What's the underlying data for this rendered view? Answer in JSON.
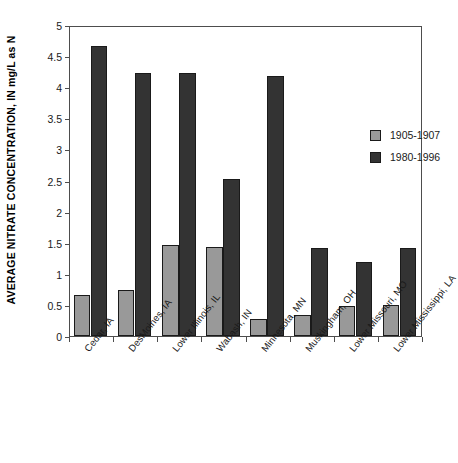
{
  "chart_data": {
    "type": "bar",
    "title": "",
    "xlabel": "",
    "ylabel": "AVERAGE NITRATE CONCENTRATION, IN mg/L as N",
    "ylim": [
      0,
      5
    ],
    "ytick_values": [
      0,
      0.5,
      1,
      1.5,
      2,
      2.5,
      3,
      3.5,
      4,
      4.5,
      5
    ],
    "ytick_labels": [
      "0",
      "0.5",
      "1",
      "1.5",
      "2",
      "2.5",
      "3",
      "3.5",
      "4",
      "4.5",
      "5"
    ],
    "grid": false,
    "legend_position": "upper-right-inside",
    "categories": [
      "Cedar, IA",
      "DesMoines, IA",
      "Lower Illinois, IL",
      "Wabash, IN",
      "Minnesota, MN",
      "Muskingham, OH",
      "Lower Missouri, MO",
      "Lower Mississippi, LA"
    ],
    "series": [
      {
        "name": "1905-1907",
        "color": "#999999",
        "values": [
          0.66,
          0.74,
          1.47,
          1.43,
          0.27,
          0.33,
          0.49,
          0.5
        ]
      },
      {
        "name": "1980-1996",
        "color": "#333333",
        "values": [
          4.67,
          4.23,
          4.23,
          2.53,
          4.18,
          1.42,
          1.19,
          1.42
        ]
      }
    ]
  },
  "legend": {
    "entries": [
      {
        "label": "1905-1907",
        "swatch": "old"
      },
      {
        "label": "1980-1996",
        "swatch": "new"
      }
    ]
  }
}
